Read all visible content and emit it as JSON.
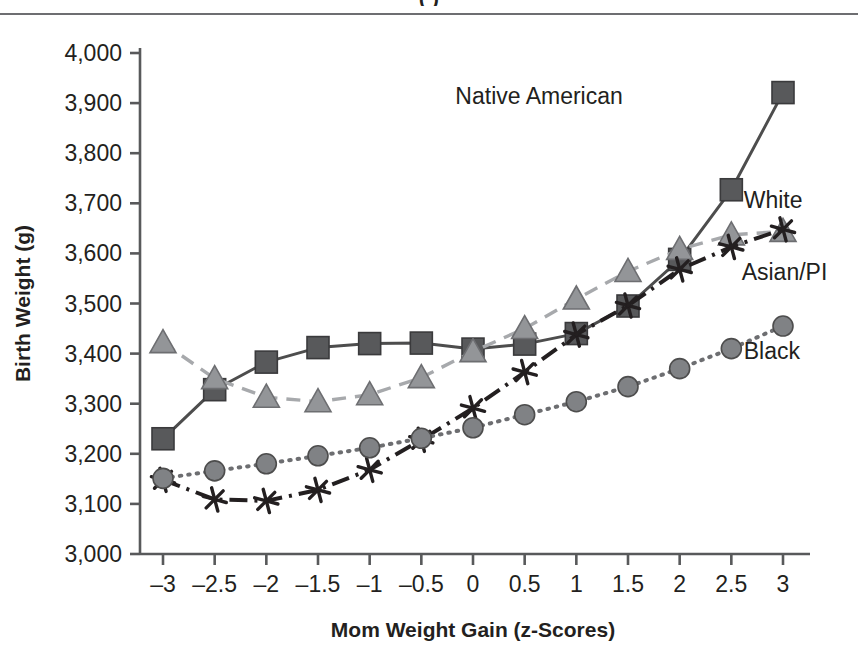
{
  "page": {
    "top_fragment_text": "(           )",
    "divider_color": "#6d6e71",
    "background": "#ffffff"
  },
  "chart_data": {
    "type": "line",
    "title": "",
    "xlabel": "Mom Weight Gain (z-Scores)",
    "ylabel": "Birth Weight (g)",
    "x": [
      -3,
      -2.5,
      -2,
      -1.5,
      -1,
      -0.5,
      0,
      0.5,
      1,
      1.5,
      2,
      2.5,
      3
    ],
    "xtick_labels": [
      "–3",
      "–2.5",
      "–2",
      "–1.5",
      "–1",
      "–0.5",
      "0",
      "0.5",
      "1",
      "1.5",
      "2",
      "2.5",
      "3"
    ],
    "ytick_labels": [
      "3,000",
      "3,100",
      "3,200",
      "3,300",
      "3,400",
      "3,500",
      "3,600",
      "3,700",
      "3,800",
      "3,900",
      "4,000"
    ],
    "yticks": [
      3000,
      3100,
      3200,
      3300,
      3400,
      3500,
      3600,
      3700,
      3800,
      3900,
      4000
    ],
    "xlim": [
      -3,
      3
    ],
    "ylim": [
      3000,
      4000
    ],
    "grid": false,
    "legend_position": "inline-right-labels",
    "series": [
      {
        "name": "Native American",
        "marker": "square",
        "linestyle": "solid",
        "color": "#4d4d4d",
        "marker_fill": "#58595b",
        "label_x": 1.45,
        "label_y": 3915,
        "values": [
          3230,
          3328,
          3383,
          3412,
          3420,
          3421,
          3409,
          3419,
          3440,
          3495,
          3588,
          3727,
          3921
        ]
      },
      {
        "name": "White",
        "marker": "triangle",
        "linestyle": "dashed",
        "color": "#a7a9ac",
        "marker_fill": "#939598",
        "label_x": 2.62,
        "label_y": 3707,
        "values": [
          3422,
          3350,
          3313,
          3304,
          3318,
          3352,
          3404,
          3450,
          3509,
          3564,
          3608,
          3637,
          3644
        ]
      },
      {
        "name": "Asian/PI",
        "marker": "asterisk",
        "linestyle": "dashdot",
        "color": "#231f20",
        "marker_fill": "#231f20",
        "label_x": 2.6,
        "label_y": 3562,
        "values": [
          3148,
          3109,
          3106,
          3128,
          3168,
          3228,
          3291,
          3363,
          3438,
          3496,
          3568,
          3613,
          3648
        ]
      },
      {
        "name": "Black",
        "marker": "circle",
        "linestyle": "dotted",
        "color": "#6d6e71",
        "marker_fill": "#808285",
        "label_x": 2.62,
        "label_y": 3405,
        "values": [
          3151,
          3166,
          3180,
          3196,
          3212,
          3231,
          3252,
          3278,
          3304,
          3334,
          3370,
          3410,
          3455
        ]
      }
    ]
  }
}
